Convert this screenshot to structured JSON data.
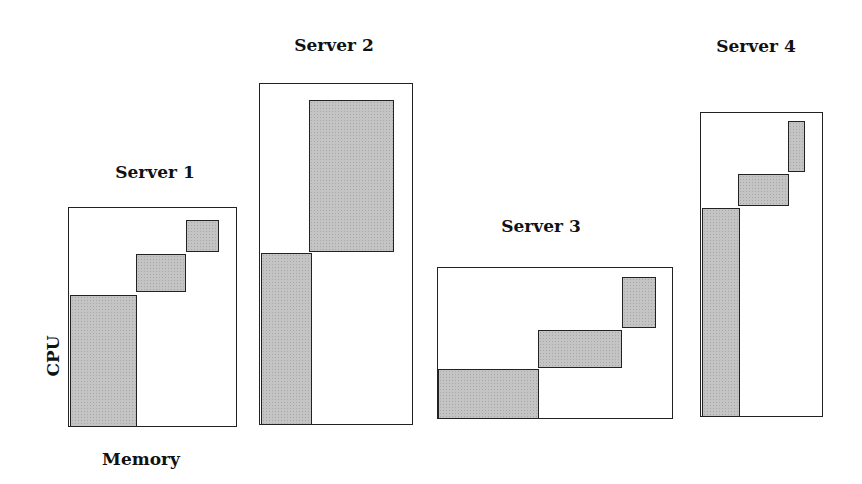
{
  "figure": {
    "axis_labels": {
      "y": "CPU",
      "x": "Memory"
    },
    "shade_color": "#c4c4c4",
    "servers": [
      {
        "name": "Server 1",
        "title_pos": [
          155,
          172
        ],
        "box": [
          68,
          207,
          169,
          220
        ],
        "blocks": [
          [
            70,
            295,
            67,
            132
          ],
          [
            136,
            254,
            50,
            38
          ],
          [
            186,
            220,
            33,
            32
          ]
        ]
      },
      {
        "name": "Server 2",
        "title_pos": [
          334,
          45
        ],
        "box": [
          259,
          83,
          154,
          342
        ],
        "blocks": [
          [
            309,
            100,
            85,
            152
          ],
          [
            261,
            253,
            51,
            172
          ]
        ]
      },
      {
        "name": "Server 3",
        "title_pos": [
          541,
          226
        ],
        "box": [
          437,
          267,
          236,
          152
        ],
        "blocks": [
          [
            438,
            369,
            101,
            50
          ],
          [
            538,
            330,
            84,
            38
          ],
          [
            622,
            277,
            34,
            51
          ]
        ]
      },
      {
        "name": "Server 4",
        "title_pos": [
          756,
          46
        ],
        "box": [
          700,
          112,
          123,
          305
        ],
        "blocks": [
          [
            702,
            208,
            38,
            209
          ],
          [
            738,
            174,
            51,
            32
          ],
          [
            788,
            121,
            17,
            51
          ]
        ]
      }
    ]
  }
}
